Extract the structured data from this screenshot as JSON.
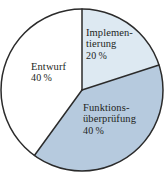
{
  "chart_data": {
    "type": "pie",
    "title": "",
    "subtitle": "",
    "xlabel": "",
    "ylabel": "",
    "legend_position": "none",
    "grid": false,
    "start_angle_deg": 0,
    "direction": "clockwise",
    "categories": [
      "Implementierung",
      "Funktionsüberprüfung",
      "Entwurf"
    ],
    "values": [
      20,
      40,
      40
    ],
    "value_unit": "%",
    "slices": [
      {
        "name": "Implementierung",
        "label_line1": "Implemen-",
        "label_line2": "tierung",
        "value": 20,
        "value_label": "20 %",
        "color": "#dde9f2",
        "start_angle_deg": 0,
        "end_angle_deg": 72
      },
      {
        "name": "Funktionsüberprüfung",
        "label_line1": "Funktions-",
        "label_line2": "überprüfung",
        "value": 40,
        "value_label": "40 %",
        "color": "#b6cade",
        "start_angle_deg": 72,
        "end_angle_deg": 216
      },
      {
        "name": "Entwurf",
        "label_line1": "Entwurf",
        "label_line2": "",
        "value": 40,
        "value_label": "40 %",
        "color": "#ffffff",
        "start_angle_deg": 216,
        "end_angle_deg": 360
      }
    ],
    "geometry": {
      "center_x": 82,
      "center_y": 90,
      "radius": 81
    },
    "style": {
      "outline_color": "#2b2b2b",
      "outline_width": 1.5,
      "divider_color": "#2b2b2b",
      "divider_width": 1.5,
      "background": "#ffffff",
      "text_color": "#221f1c"
    }
  }
}
